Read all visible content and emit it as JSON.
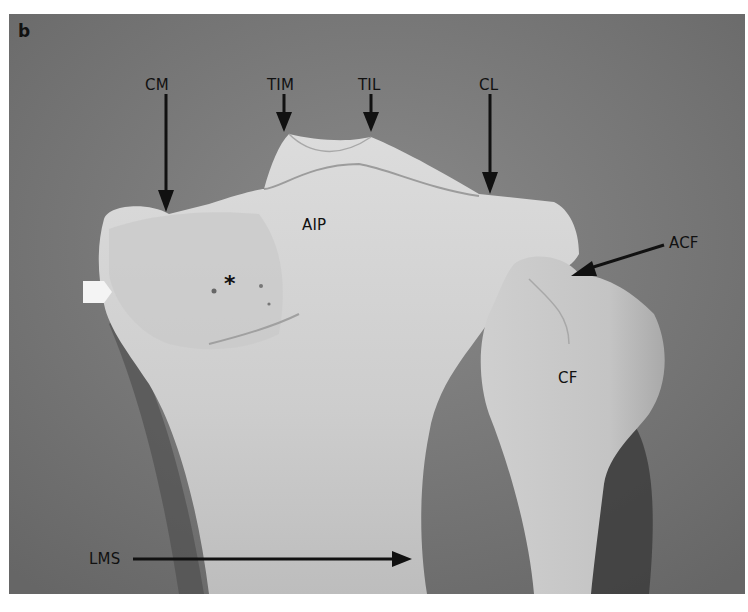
{
  "figure": {
    "panel_label": "b",
    "labels": {
      "cm": "CM",
      "tim": "TIM",
      "til": "TIL",
      "cl": "CL",
      "aip": "AIP",
      "acf": "ACF",
      "cf": "CF",
      "lms": "LMS",
      "asterisk": "*"
    },
    "colors": {
      "background": "#727272",
      "bone": "#d3d3d3",
      "arrow": "#111111",
      "white_arrow": "#f4f4f4"
    }
  }
}
